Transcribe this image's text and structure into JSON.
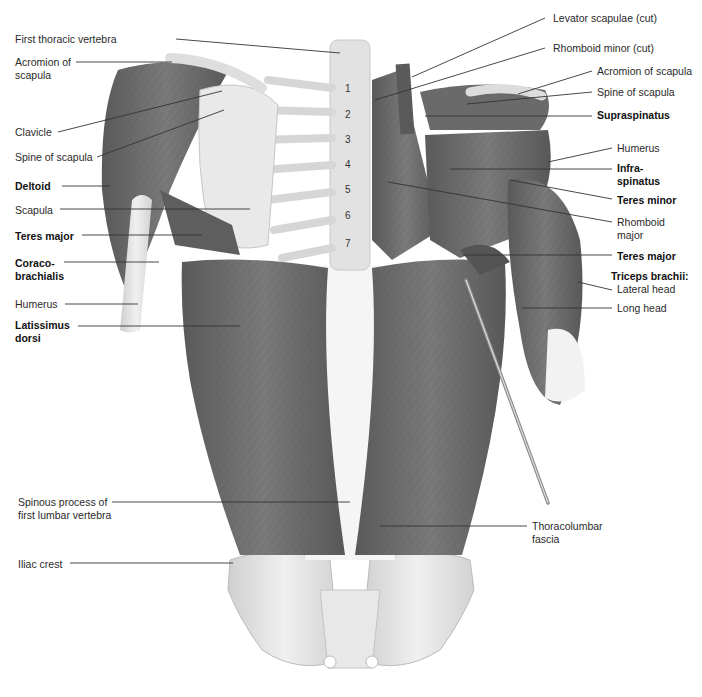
{
  "diagram": {
    "type": "anatomical-illustration",
    "view": "Posterior view of superficial and deep back muscles",
    "colors": {
      "muscle": "#6e6e6e",
      "muscle_dark": "#4f4f4f",
      "bone": "#e4e4e4",
      "fascia": "#f4f4f4",
      "leader_line": "#333333",
      "text": "#2a2a2a"
    },
    "vertebra_numbers": [
      "1",
      "2",
      "3",
      "4",
      "5",
      "6",
      "7"
    ],
    "labels_left": [
      {
        "id": "first-thoracic-vertebra",
        "text": "First thoracic vertebra",
        "bold": false,
        "x": 15,
        "y": 33,
        "line": [
          176,
          39,
          340,
          53
        ]
      },
      {
        "id": "acromion-of-scapula-left",
        "text": "Acromion of\nscapula",
        "bold": false,
        "x": 15,
        "y": 56,
        "line": [
          76,
          62,
          172,
          62
        ]
      },
      {
        "id": "clavicle",
        "text": "Clavicle",
        "bold": false,
        "x": 15,
        "y": 126,
        "line": [
          58,
          132,
          222,
          91
        ]
      },
      {
        "id": "spine-of-scapula-left",
        "text": "Spine of scapula",
        "bold": false,
        "x": 15,
        "y": 151,
        "line": [
          97,
          157,
          224,
          110
        ]
      },
      {
        "id": "deltoid",
        "text": "Deltoid",
        "bold": true,
        "x": 15,
        "y": 180,
        "line": [
          62,
          186,
          110,
          186
        ]
      },
      {
        "id": "scapula",
        "text": "Scapula",
        "bold": false,
        "x": 15,
        "y": 204,
        "line": [
          60,
          209,
          250,
          209
        ]
      },
      {
        "id": "teres-major-left",
        "text": "Teres major",
        "bold": true,
        "x": 15,
        "y": 230,
        "line": [
          82,
          235,
          202,
          235
        ]
      },
      {
        "id": "coracobrachialis",
        "text": "Coraco-\nbrachialis",
        "bold": true,
        "x": 15,
        "y": 257,
        "line": [
          64,
          262,
          159,
          262
        ]
      },
      {
        "id": "humerus-left",
        "text": "Humerus",
        "bold": false,
        "x": 15,
        "y": 298,
        "line": [
          65,
          304,
          138,
          304
        ]
      },
      {
        "id": "latissimus-dorsi",
        "text": "Latissimus\ndorsi",
        "bold": true,
        "x": 15,
        "y": 319,
        "line": [
          78,
          326,
          240,
          326
        ]
      },
      {
        "id": "spinous-process-l1",
        "text": "Spinous process of\nfirst lumbar vertebra",
        "bold": false,
        "x": 18,
        "y": 496,
        "line": [
          112,
          502,
          350,
          502
        ]
      },
      {
        "id": "iliac-crest",
        "text": "Iliac crest",
        "bold": false,
        "x": 18,
        "y": 558,
        "line": [
          70,
          563,
          233,
          563
        ]
      }
    ],
    "labels_right": [
      {
        "id": "levator-scapulae-cut",
        "text": "Levator scapulae (cut)",
        "bold": false,
        "x": 553,
        "y": 12,
        "line": [
          545,
          18,
          412,
          77
        ]
      },
      {
        "id": "rhomboid-minor-cut",
        "text": "Rhomboid minor (cut)",
        "bold": false,
        "x": 553,
        "y": 42,
        "line": [
          545,
          48,
          375,
          100
        ]
      },
      {
        "id": "acromion-of-scapula-right",
        "text": "Acromion of scapula",
        "bold": false,
        "x": 597,
        "y": 65,
        "line": [
          592,
          71,
          518,
          94
        ]
      },
      {
        "id": "spine-of-scapula-right",
        "text": "Spine of scapula",
        "bold": false,
        "x": 597,
        "y": 86,
        "line": [
          592,
          92,
          467,
          104
        ]
      },
      {
        "id": "supraspinatus",
        "text": "Supraspinatus",
        "bold": true,
        "x": 597,
        "y": 109,
        "line": [
          592,
          116,
          425,
          116
        ]
      },
      {
        "id": "humerus-right",
        "text": "Humerus",
        "bold": false,
        "x": 617,
        "y": 142,
        "line": [
          612,
          148,
          548,
          162
        ]
      },
      {
        "id": "infraspinatus",
        "text": "Infra-\nspinatus",
        "bold": true,
        "x": 617,
        "y": 162,
        "line": [
          612,
          169,
          450,
          169
        ]
      },
      {
        "id": "teres-minor",
        "text": "Teres minor",
        "bold": true,
        "x": 617,
        "y": 194,
        "line": [
          612,
          199,
          510,
          180
        ]
      },
      {
        "id": "rhomboid-major",
        "text": "Rhomboid\nmajor",
        "bold": false,
        "x": 617,
        "y": 216,
        "line": [
          612,
          222,
          388,
          182
        ]
      },
      {
        "id": "teres-major-right",
        "text": "Teres major",
        "bold": true,
        "x": 617,
        "y": 250,
        "line": [
          612,
          255,
          463,
          255
        ]
      },
      {
        "id": "triceps-brachii",
        "text": "Triceps brachii:",
        "bold": true,
        "x": 611,
        "y": 270,
        "line": null
      },
      {
        "id": "triceps-lateral-head",
        "text": "Lateral head",
        "bold": false,
        "x": 617,
        "y": 283,
        "line": [
          612,
          290,
          578,
          282
        ]
      },
      {
        "id": "triceps-long-head",
        "text": "Long head",
        "bold": false,
        "x": 617,
        "y": 302,
        "line": [
          612,
          308,
          522,
          308
        ]
      },
      {
        "id": "thoracolumbar-fascia",
        "text": "Thoracolumbar\nfascia",
        "bold": false,
        "x": 532,
        "y": 520,
        "line": [
          527,
          526,
          380,
          526
        ]
      }
    ]
  }
}
